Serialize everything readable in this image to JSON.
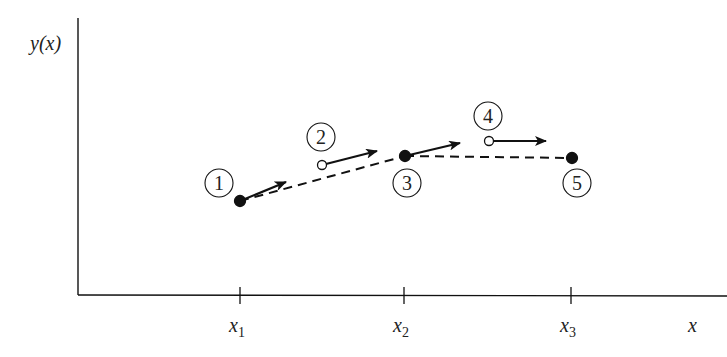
{
  "axes": {
    "y_label": "y(x)",
    "x_label": "x",
    "ticks": [
      {
        "label": "x",
        "sub": "1",
        "x": 240
      },
      {
        "label": "x",
        "sub": "2",
        "x": 404
      },
      {
        "label": "x",
        "sub": "3",
        "x": 571
      }
    ]
  },
  "points": [
    {
      "id": "1",
      "x": 240,
      "y": 201,
      "filled": true,
      "label_x": 219,
      "label_y": 183,
      "arrow_to": [
        286,
        182
      ]
    },
    {
      "id": "2",
      "x": 322,
      "y": 165,
      "filled": false,
      "label_x": 321,
      "label_y": 137,
      "arrow_to": [
        377,
        151
      ]
    },
    {
      "id": "3",
      "x": 405,
      "y": 156,
      "filled": true,
      "label_x": 407,
      "label_y": 183,
      "arrow_to": [
        460,
        143
      ]
    },
    {
      "id": "4",
      "x": 489,
      "y": 141,
      "filled": false,
      "label_x": 488,
      "label_y": 116,
      "arrow_to": [
        546,
        141
      ]
    },
    {
      "id": "5",
      "x": 572,
      "y": 158,
      "filled": true,
      "label_x": 577,
      "label_y": 183,
      "arrow_to": null
    }
  ],
  "dashed_segments": [
    {
      "from": "1",
      "to": "3"
    },
    {
      "from": "3",
      "to": "5"
    }
  ],
  "colors": {
    "ink": "#111111",
    "background": "#ffffff"
  }
}
